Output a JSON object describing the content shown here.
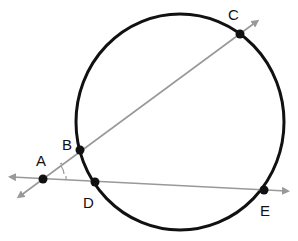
{
  "diagram": {
    "type": "geometry",
    "colors": {
      "circle": "#111111",
      "lines": "#999999",
      "points": "#111111",
      "background": "#ffffff"
    },
    "circle": {
      "cx": 180,
      "cy": 122,
      "rx": 104,
      "ry": 108
    },
    "points": [
      {
        "id": "A",
        "label": "A",
        "x": 43,
        "y": 179,
        "label_x": 36,
        "label_y": 166
      },
      {
        "id": "B",
        "label": "B",
        "x": 80,
        "y": 150,
        "label_x": 63,
        "label_y": 148
      },
      {
        "id": "C",
        "label": "C",
        "x": 240,
        "y": 34,
        "label_x": 228,
        "label_y": 18
      },
      {
        "id": "D",
        "label": "D",
        "x": 95,
        "y": 182,
        "label_x": 83,
        "label_y": 206
      },
      {
        "id": "E",
        "label": "E",
        "x": 264,
        "y": 190,
        "label_x": 260,
        "label_y": 216
      }
    ],
    "secants": [
      {
        "name": "secant-ABC",
        "through": [
          "A",
          "B",
          "C"
        ],
        "from": [
          16,
          199
        ],
        "to": [
          260,
          19
        ]
      },
      {
        "name": "secant-ADE",
        "through": [
          "A",
          "D",
          "E"
        ],
        "from": [
          8,
          177
        ],
        "to": [
          290,
          191
        ]
      }
    ],
    "angle_marks": [
      {
        "at": "A",
        "description": "angle at A between the two secants"
      }
    ]
  }
}
